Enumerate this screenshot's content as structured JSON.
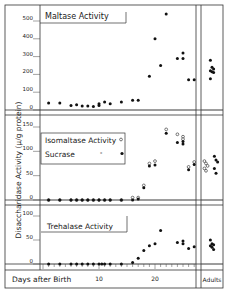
{
  "chart_data": [
    {
      "type": "scatter",
      "title": "Maltase Activity",
      "xlabel": "Days after Birth",
      "ylabel": "Disaccharidase Activity (µ/g protein)",
      "ylim": [
        0,
        550
      ],
      "yticks": [
        0,
        100,
        200,
        300,
        400,
        500
      ],
      "xlim": [
        0,
        28
      ],
      "series": [
        {
          "name": "Maltase",
          "marker": "filled",
          "points": [
            [
              1,
              40
            ],
            [
              3,
              40
            ],
            [
              5,
              25
            ],
            [
              6,
              30
            ],
            [
              7,
              22
            ],
            [
              8,
              22
            ],
            [
              9,
              20
            ],
            [
              10,
              25
            ],
            [
              10,
              35
            ],
            [
              11,
              45
            ],
            [
              12,
              35
            ],
            [
              14,
              45
            ],
            [
              16,
              55
            ],
            [
              17,
              55
            ],
            [
              19,
              190
            ],
            [
              20,
              400
            ],
            [
              21,
              250
            ],
            [
              22,
              540
            ],
            [
              24,
              290
            ],
            [
              25,
              320
            ],
            [
              25,
              290
            ],
            [
              26,
              170
            ],
            [
              27,
              170
            ]
          ]
        },
        {
          "name": "Maltase Adults",
          "marker": "filled",
          "adults": true,
          "points": [
            [
              0,
              280
            ],
            [
              0,
              240
            ],
            [
              0,
              230
            ],
            [
              0,
              220
            ],
            [
              0,
              215
            ],
            [
              0,
              210
            ],
            [
              0,
              175
            ]
          ]
        }
      ]
    },
    {
      "type": "scatter",
      "title": "Isomaltase Activity / Sucrase",
      "legend": [
        {
          "label": "Isomaltase Activity",
          "marker": "open"
        },
        {
          "label": "Sucrase",
          "marker": "filled"
        }
      ],
      "ylim": [
        0,
        160
      ],
      "yticks": [
        0,
        50,
        100,
        150
      ],
      "xlim": [
        0,
        28
      ],
      "series": [
        {
          "name": "Isomaltase",
          "marker": "open",
          "points": [
            [
              1,
              0
            ],
            [
              3,
              0
            ],
            [
              5,
              0
            ],
            [
              6,
              0
            ],
            [
              7,
              0
            ],
            [
              8,
              0
            ],
            [
              9,
              0
            ],
            [
              10,
              0
            ],
            [
              11,
              0
            ],
            [
              12,
              0
            ],
            [
              14,
              0
            ],
            [
              16,
              5
            ],
            [
              17,
              5
            ],
            [
              18,
              30
            ],
            [
              19,
              75
            ],
            [
              20,
              80
            ],
            [
              22,
              145
            ],
            [
              24,
              135
            ],
            [
              25,
              130
            ],
            [
              25,
              125
            ],
            [
              26,
              68
            ],
            [
              27,
              78
            ]
          ]
        },
        {
          "name": "Sucrase",
          "marker": "filled",
          "points": [
            [
              1,
              0
            ],
            [
              3,
              0
            ],
            [
              5,
              0
            ],
            [
              6,
              0
            ],
            [
              7,
              0
            ],
            [
              8,
              0
            ],
            [
              9,
              0
            ],
            [
              10,
              0
            ],
            [
              11,
              0
            ],
            [
              12,
              0
            ],
            [
              14,
              0
            ],
            [
              16,
              0
            ],
            [
              17,
              2
            ],
            [
              18,
              25
            ],
            [
              19,
              70
            ],
            [
              20,
              72
            ],
            [
              22,
              137
            ],
            [
              24,
              118
            ],
            [
              25,
              115
            ],
            [
              25,
              120
            ],
            [
              26,
              62
            ],
            [
              27,
              73
            ]
          ]
        },
        {
          "name": "Isomaltase Adults",
          "marker": "open",
          "adults": true,
          "points": [
            [
              0,
              80
            ],
            [
              0,
              75
            ],
            [
              0,
              70
            ],
            [
              0,
              65
            ],
            [
              0,
              60
            ]
          ]
        },
        {
          "name": "Sucrase Adults",
          "marker": "filled",
          "adults": true,
          "points": [
            [
              0,
              90
            ],
            [
              0,
              82
            ],
            [
              0,
              78
            ],
            [
              0,
              65
            ],
            [
              0,
              55
            ]
          ]
        }
      ]
    },
    {
      "type": "scatter",
      "title": "Trehalase Activity",
      "ylim": [
        0,
        110
      ],
      "yticks": [
        0,
        50,
        100
      ],
      "xlim": [
        0,
        28
      ],
      "xticks": [
        10,
        20
      ],
      "series": [
        {
          "name": "Trehalase",
          "marker": "filled",
          "points": [
            [
              1,
              0
            ],
            [
              3,
              0
            ],
            [
              5,
              0
            ],
            [
              6,
              0
            ],
            [
              7,
              0
            ],
            [
              8,
              0
            ],
            [
              9,
              0
            ],
            [
              10,
              0
            ],
            [
              10.5,
              0
            ],
            [
              11,
              0
            ],
            [
              12,
              0
            ],
            [
              14,
              0
            ],
            [
              16,
              3
            ],
            [
              17,
              12
            ],
            [
              18,
              28
            ],
            [
              19,
              38
            ],
            [
              20,
              42
            ],
            [
              21,
              70
            ],
            [
              24,
              45
            ],
            [
              25,
              48
            ],
            [
              25,
              42
            ],
            [
              26,
              32
            ],
            [
              27,
              36
            ]
          ]
        },
        {
          "name": "Trehalase Adults",
          "marker": "filled",
          "adults": true,
          "points": [
            [
              0,
              50
            ],
            [
              0,
              42
            ],
            [
              0,
              40
            ],
            [
              0,
              38
            ],
            [
              0,
              35
            ],
            [
              0,
              30
            ]
          ]
        }
      ]
    }
  ],
  "labels": {
    "x_axis": "Days after Birth",
    "adults": "Adults",
    "y_axis": "Disaccharidase Activity (µ/g protein)",
    "x_tick_10": "10",
    "x_tick_20": "20",
    "maltase_title": "Maltase Activity",
    "isomaltase_legend": "Isomaltase Activity",
    "sucrase_legend": "Sucrase",
    "trehalase_title": "Trehalase Activity"
  }
}
